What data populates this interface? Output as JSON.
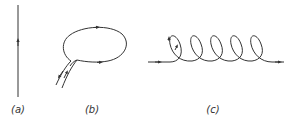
{
  "figure": {
    "panels": [
      {
        "id": "a",
        "label": "(a)",
        "description": "straight vertical line with upward arrow",
        "label_x": 18
      },
      {
        "id": "b",
        "label": "(b)",
        "description": "closed loop with incoming and outgoing pair of lines",
        "label_x": 92
      },
      {
        "id": "c",
        "label": "(c)",
        "description": "horizontal line with five helical loops, arrows left-to-right",
        "label_x": 213
      }
    ],
    "colors": {
      "stroke": "#333333",
      "background": "#ffffff"
    }
  }
}
